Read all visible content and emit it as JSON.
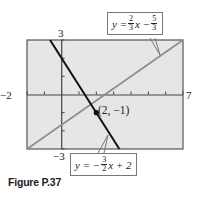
{
  "chart_data": {
    "type": "line",
    "title": "",
    "xlabel": "",
    "ylabel": "",
    "xlim": [
      -2,
      7
    ],
    "ylim": [
      -3,
      3
    ],
    "x_tick_step": 1,
    "y_tick_step": 1,
    "axis_end_labels": {
      "xmin": "−2",
      "xmax": "7",
      "ymax": "3",
      "ymin": "−3"
    },
    "grid": false,
    "series": [
      {
        "name": "y = (2/3)x − 5/3",
        "slope": 0.6667,
        "intercept": -1.6667,
        "color": "#8c8c8c",
        "points": [
          [
            -2,
            -3
          ],
          [
            7,
            3
          ]
        ]
      },
      {
        "name": "y = −(3/2)x + 2",
        "slope": -1.5,
        "intercept": 2,
        "color": "#111111",
        "points": [
          [
            -0.67,
            3
          ],
          [
            3.33,
            -3
          ]
        ]
      }
    ],
    "annotations": [
      {
        "type": "point",
        "x": 2,
        "y": -1,
        "label": "(2, −1)"
      }
    ]
  },
  "labels": {
    "xmin": "−2",
    "xmax": "7",
    "ymax": "3",
    "ymin": "−3",
    "point": "(2, −1)",
    "eq1": {
      "lhs": "y =",
      "num1": "2",
      "den1": "3",
      "mid": "x −",
      "num2": "5",
      "den2": "3"
    },
    "eq2": {
      "lhs": "y = −",
      "num1": "3",
      "den1": "2",
      "rest": "x + 2"
    }
  },
  "caption": "Figure P.37",
  "colors": {
    "plot_bg": "#e6e6e6",
    "frame": "#555555",
    "line1": "#8c8c8c",
    "line2": "#111111"
  }
}
